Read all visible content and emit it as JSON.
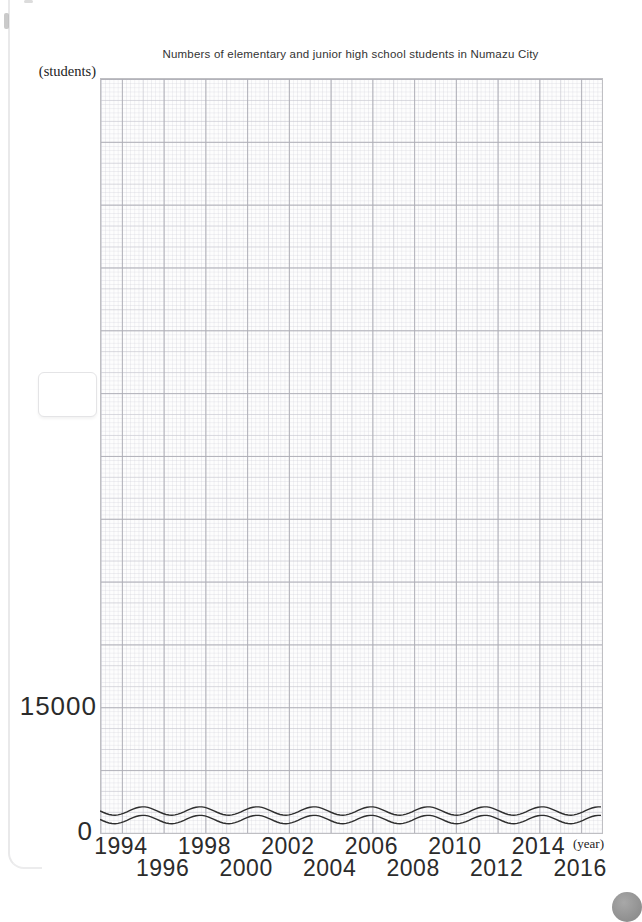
{
  "title": "Numbers of elementary and junior high school students in Numazu City",
  "axis_labels": {
    "y_unit": "(students)",
    "x_unit": "(year)"
  },
  "y_ticks": {
    "upper": "15000",
    "origin": "0"
  },
  "x_ticks": [
    {
      "year": "1994",
      "row": 1
    },
    {
      "year": "1996",
      "row": 2
    },
    {
      "year": "1998",
      "row": 1
    },
    {
      "year": "2000",
      "row": 2
    },
    {
      "year": "2002",
      "row": 1
    },
    {
      "year": "2004",
      "row": 2
    },
    {
      "year": "2006",
      "row": 1
    },
    {
      "year": "2008",
      "row": 2
    },
    {
      "year": "2010",
      "row": 1
    },
    {
      "year": "2012",
      "row": 2
    },
    {
      "year": "2014",
      "row": 1
    },
    {
      "year": "2016",
      "row": 2
    }
  ],
  "chart_data": {
    "type": "line",
    "title": "Numbers of elementary and junior high school students in Numazu City",
    "xlabel": "(year)",
    "ylabel": "(students)",
    "x_tick_values": [
      1994,
      1996,
      1998,
      2000,
      2002,
      2004,
      2006,
      2008,
      2010,
      2012,
      2014,
      2016
    ],
    "x_range": [
      1993,
      2017
    ],
    "y_tick_labels": [
      0,
      15000
    ],
    "y_axis_break": true,
    "grid": "millimeter graph paper (fine 1-unit, medium 5-unit, bold major lines), grid on",
    "legend": "none",
    "series": []
  },
  "colors": {
    "paper": "#fdfdfd",
    "grid_major": "#acacb4",
    "grid_medium": "#c4c4cd",
    "grid_fine": "#cacad4",
    "plot_border": "#bfbfc3",
    "text": "#2b2b2b",
    "axis_break_line": "#2e2e2e",
    "corner_badge": "#9a9a9a",
    "page_edge": "#e9e9ea"
  },
  "decorations": {
    "answer_box": "empty rounded rectangle left of the grid",
    "corner_badge": "gray circular page badge, bottom-right, partially cut off",
    "page_edge": "faint notebook page edge line along the left side"
  }
}
